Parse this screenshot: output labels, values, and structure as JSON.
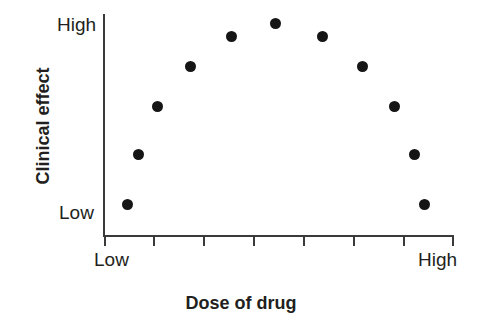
{
  "figure": {
    "width": 482,
    "height": 327,
    "background": "#ffffff",
    "ink_color": "#231f20",
    "marker_color": "#151515"
  },
  "axes": {
    "y_high_label": "High",
    "y_low_label": "Low",
    "x_low_label": "Low",
    "x_high_label": "High",
    "y_title": "Clinical effect",
    "x_title": "Dose of drug"
  },
  "chart_data": {
    "type": "scatter",
    "title": "",
    "subtitle": "",
    "xlabel": "Dose of drug",
    "ylabel": "Clinical effect",
    "xlim": [
      0,
      1
    ],
    "ylim": [
      0,
      1
    ],
    "xtick_labels": [
      "Low",
      "High"
    ],
    "ytick_labels": [
      "Low",
      "High"
    ],
    "x_tick_count": 8,
    "grid": false,
    "legend": null,
    "annotations": [],
    "series": [
      {
        "name": "Clinical effect vs dose",
        "marker": "filled-circle",
        "marker_color": "#151515",
        "marker_size_px": 11,
        "points": [
          {
            "x": 0.068,
            "y": 0.144,
            "px": 127,
            "py": 204
          },
          {
            "x": 0.1,
            "y": 0.369,
            "px": 138,
            "py": 154
          },
          {
            "x": 0.154,
            "y": 0.586,
            "px": 157,
            "py": 106
          },
          {
            "x": 0.248,
            "y": 0.766,
            "px": 190,
            "py": 66
          },
          {
            "x": 0.365,
            "y": 0.901,
            "px": 231,
            "py": 36
          },
          {
            "x": 0.491,
            "y": 0.959,
            "px": 275,
            "py": 23
          },
          {
            "x": 0.625,
            "y": 0.901,
            "px": 322,
            "py": 36
          },
          {
            "x": 0.74,
            "y": 0.766,
            "px": 362,
            "py": 66
          },
          {
            "x": 0.831,
            "y": 0.586,
            "px": 394,
            "py": 106
          },
          {
            "x": 0.888,
            "y": 0.369,
            "px": 414,
            "py": 154
          },
          {
            "x": 0.917,
            "y": 0.144,
            "px": 424,
            "py": 204
          }
        ]
      }
    ]
  },
  "x_ticks": [
    {
      "px": 104
    },
    {
      "px": 153
    },
    {
      "px": 203
    },
    {
      "px": 253
    },
    {
      "px": 303
    },
    {
      "px": 353
    },
    {
      "px": 403
    },
    {
      "px": 452
    }
  ]
}
